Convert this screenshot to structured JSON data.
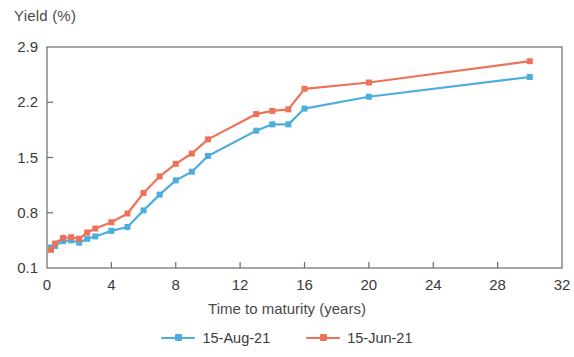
{
  "chart_data": {
    "type": "line",
    "title": "",
    "xlabel": "Time to maturity (years)",
    "ylabel": "Yield (%)",
    "xlim": [
      0,
      32
    ],
    "ylim": [
      0.1,
      2.9
    ],
    "xticks": [
      "0",
      "4",
      "8",
      "12",
      "16",
      "20",
      "24",
      "28",
      "32"
    ],
    "yticks": [
      "0.1",
      "0.8",
      "1.5",
      "2.2",
      "2.9"
    ],
    "xtick_values": [
      0,
      4,
      8,
      12,
      16,
      20,
      24,
      28,
      32
    ],
    "ytick_values": [
      0.1,
      0.8,
      1.5,
      2.2,
      2.9
    ],
    "grid": false,
    "legend_position": "below",
    "markers": "square",
    "series": [
      {
        "name": "15-Aug-21",
        "color": "#4BAEDD",
        "points": [
          [
            0.25,
            0.36
          ],
          [
            0.5,
            0.38
          ],
          [
            1.0,
            0.44
          ],
          [
            1.5,
            0.45
          ],
          [
            2.0,
            0.42
          ],
          [
            2.5,
            0.47
          ],
          [
            3.0,
            0.5
          ],
          [
            4.0,
            0.57
          ],
          [
            5.0,
            0.62
          ],
          [
            6.0,
            0.83
          ],
          [
            7.0,
            1.03
          ],
          [
            8.0,
            1.21
          ],
          [
            9.0,
            1.32
          ],
          [
            10.0,
            1.52
          ],
          [
            13.0,
            1.84
          ],
          [
            14.0,
            1.92
          ],
          [
            15.0,
            1.92
          ],
          [
            16.0,
            2.12
          ],
          [
            20.0,
            2.27
          ],
          [
            30.0,
            2.52
          ]
        ]
      },
      {
        "name": "15-Jun-21",
        "color": "#EE7259",
        "points": [
          [
            0.25,
            0.33
          ],
          [
            0.5,
            0.41
          ],
          [
            1.0,
            0.48
          ],
          [
            1.5,
            0.49
          ],
          [
            2.0,
            0.47
          ],
          [
            2.5,
            0.55
          ],
          [
            3.0,
            0.6
          ],
          [
            4.0,
            0.68
          ],
          [
            5.0,
            0.79
          ],
          [
            6.0,
            1.05
          ],
          [
            7.0,
            1.26
          ],
          [
            8.0,
            1.42
          ],
          [
            9.0,
            1.55
          ],
          [
            10.0,
            1.73
          ],
          [
            13.0,
            2.05
          ],
          [
            14.0,
            2.09
          ],
          [
            15.0,
            2.11
          ],
          [
            16.0,
            2.37
          ],
          [
            20.0,
            2.45
          ],
          [
            30.0,
            2.72
          ]
        ]
      }
    ]
  },
  "legend": {
    "items": [
      {
        "label": "15-Aug-21",
        "color": "#4BAEDD"
      },
      {
        "label": "15-Jun-21",
        "color": "#EE7259"
      }
    ]
  },
  "axis_color": "#6b6b6b"
}
